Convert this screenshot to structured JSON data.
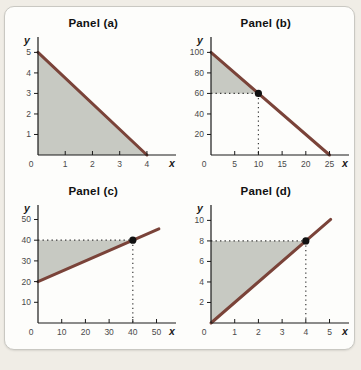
{
  "figure": {
    "panel_count": 4
  },
  "colors": {
    "page_background": "#f0ede6",
    "card_background": "#fdfdfb",
    "card_border": "#c9c8c2",
    "line": "#7a4339",
    "shade": "#c7c9c2",
    "axis": "#1a1a1a",
    "tick_label": "#4a4a4a",
    "dot": "#111111",
    "dotted_line": "#3a3a3a",
    "title": "#111111"
  },
  "axes": {
    "origin_label": "0"
  },
  "chart_data": [
    {
      "type": "line",
      "title": "Panel (a)",
      "xlabel": "x",
      "ylabel": "y",
      "xlim": [
        0,
        4.7
      ],
      "ylim": [
        0,
        5.75
      ],
      "x_ticks": [
        1,
        2,
        3,
        4
      ],
      "y_ticks": [
        1,
        2,
        3,
        4,
        5
      ],
      "line": {
        "x1": 0,
        "y1": 5,
        "x2": 4,
        "y2": 0,
        "slope": -1.25,
        "y_intercept": 5
      },
      "shade": [
        [
          0,
          0
        ],
        [
          0,
          5
        ],
        [
          4,
          0
        ]
      ],
      "point": null,
      "grid": false,
      "legend": null
    },
    {
      "type": "line",
      "title": "Panel (b)",
      "xlabel": "x",
      "ylabel": "y",
      "xlim": [
        0,
        27
      ],
      "ylim": [
        0,
        115
      ],
      "x_ticks": [
        5,
        10,
        15,
        20,
        25
      ],
      "y_ticks": [
        20,
        40,
        60,
        80,
        100
      ],
      "line": {
        "x1": 0,
        "y1": 100,
        "x2": 25,
        "y2": 0,
        "slope": -4,
        "y_intercept": 100
      },
      "shade": [
        [
          0,
          100
        ],
        [
          0,
          60
        ],
        [
          10,
          60
        ]
      ],
      "point": [
        10,
        60
      ],
      "grid": false,
      "legend": null
    },
    {
      "type": "line",
      "title": "Panel (c)",
      "xlabel": "x",
      "ylabel": "y",
      "xlim": [
        0,
        54
      ],
      "ylim": [
        0,
        57
      ],
      "x_ticks": [
        10,
        20,
        30,
        40,
        50
      ],
      "y_ticks": [
        10,
        20,
        30,
        40,
        50
      ],
      "line": {
        "x1": 0,
        "y1": 20,
        "x2": 51,
        "y2": 45.5,
        "slope": 0.5,
        "y_intercept": 20
      },
      "shade": [
        [
          0,
          20
        ],
        [
          0,
          40
        ],
        [
          40,
          40
        ]
      ],
      "point": [
        40,
        40
      ],
      "grid": false,
      "legend": null
    },
    {
      "type": "line",
      "title": "Panel (d)",
      "xlabel": "x",
      "ylabel": "y",
      "xlim": [
        0,
        5.4
      ],
      "ylim": [
        0,
        11.5
      ],
      "x_ticks": [
        1,
        2,
        3,
        4,
        5
      ],
      "y_ticks": [
        2,
        4,
        6,
        8,
        10
      ],
      "line": {
        "x1": 0,
        "y1": 0,
        "x2": 5.05,
        "y2": 10.1,
        "slope": 2,
        "y_intercept": 0
      },
      "shade": [
        [
          0,
          0
        ],
        [
          0,
          8
        ],
        [
          4,
          8
        ]
      ],
      "point": [
        4,
        8
      ],
      "grid": false,
      "legend": null
    }
  ]
}
